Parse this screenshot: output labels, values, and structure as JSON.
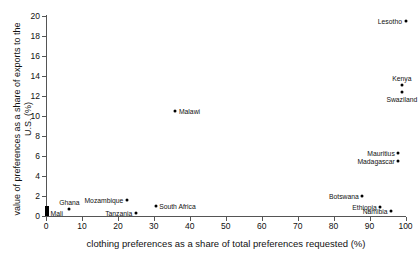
{
  "chart_data": {
    "type": "scatter",
    "title": "",
    "xlabel": "clothing preferences as a share of total preferences requested (%)",
    "ylabel": "value of preferences as a share of exports to the U.S. (%)",
    "xlim": [
      0,
      100
    ],
    "ylim": [
      0,
      20
    ],
    "xticks": [
      0,
      10,
      20,
      30,
      40,
      50,
      60,
      70,
      80,
      90,
      100
    ],
    "yticks": [
      0,
      2,
      4,
      6,
      8,
      10,
      12,
      14,
      16,
      18,
      20
    ],
    "grid": false,
    "legend": "none",
    "marker_color": "#000000",
    "points": [
      {
        "label": "Lesotho",
        "x": 100,
        "y": 19.5,
        "label_side": "left"
      },
      {
        "label": "Kenya",
        "x": 99,
        "y": 13.1,
        "label_side": "above"
      },
      {
        "label": "Swaziland",
        "x": 99,
        "y": 12.4,
        "label_side": "below"
      },
      {
        "label": "Malawi",
        "x": 36,
        "y": 10.5,
        "label_side": "right"
      },
      {
        "label": "Mauritius",
        "x": 98,
        "y": 6.3,
        "label_side": "left"
      },
      {
        "label": "Madagascar",
        "x": 98,
        "y": 5.5,
        "label_side": "left"
      },
      {
        "label": "Botswana",
        "x": 88,
        "y": 2.0,
        "label_side": "left"
      },
      {
        "label": "Mozambique",
        "x": 22.5,
        "y": 1.6,
        "label_side": "left"
      },
      {
        "label": "South Africa",
        "x": 30.5,
        "y": 1.0,
        "label_side": "right"
      },
      {
        "label": "Ethiopia",
        "x": 93,
        "y": 0.85,
        "label_side": "left"
      },
      {
        "label": "Ghana",
        "x": 6.5,
        "y": 0.7,
        "label_side": "above"
      },
      {
        "label": "Namibia",
        "x": 96,
        "y": 0.45,
        "label_side": "left"
      },
      {
        "label": "Tanzania",
        "x": 25,
        "y": 0.3,
        "label_side": "left"
      },
      {
        "label": "Mali",
        "x": 0.3,
        "y": 0.25,
        "label_side": "right"
      }
    ],
    "cluster_bar": {
      "note": "dense overlapping cluster of markers at x=0",
      "x": 0.3,
      "y_low": 0.0,
      "y_high": 0.95
    }
  }
}
